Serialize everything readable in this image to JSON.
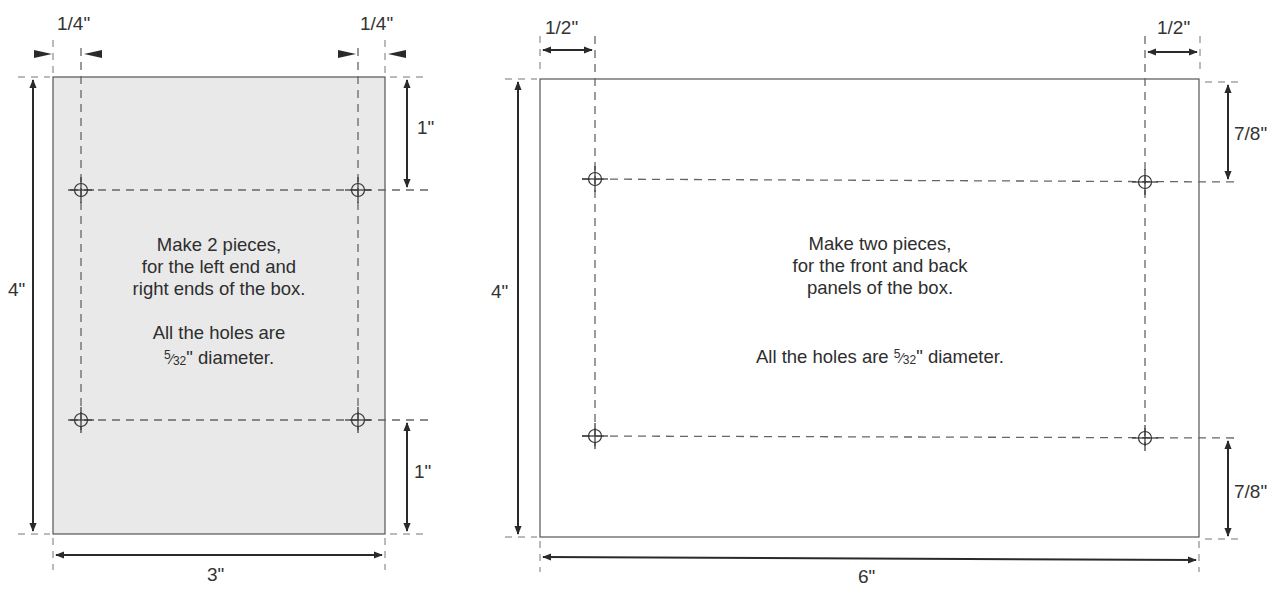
{
  "diagram": {
    "type": "technical-drawing",
    "units": "inches",
    "left_piece": {
      "name": "end panel",
      "fill": "#e9e9e9",
      "width_label": "3\"",
      "height_label": "4\"",
      "inset_left_label": "1/4\"",
      "inset_right_label": "1/4\"",
      "top_offset_label": "1\"",
      "bottom_offset_label": "1\"",
      "note_lines": [
        "Make 2 pieces,",
        "for the left end and",
        "right ends of the box."
      ],
      "hole_note_line1": "All the holes are",
      "hole_note_line2_suffix": "\" diameter.",
      "hole_diameter": {
        "num": "5",
        "den": "32"
      },
      "holes": 4
    },
    "right_piece": {
      "name": "front/back panel",
      "fill": "#ffffff",
      "width_label": "6\"",
      "height_label": "4\"",
      "inset_left_label": "1/2\"",
      "inset_right_label": "1/2\"",
      "top_offset_label": "7/8\"",
      "bottom_offset_label": "7/8\"",
      "note_lines": [
        "Make two pieces,",
        "for the front and back",
        "panels of the box."
      ],
      "hole_note_prefix": "All the holes are ",
      "hole_note_suffix": "\" diameter.",
      "hole_diameter": {
        "num": "5",
        "den": "32"
      },
      "holes": 4
    },
    "colors": {
      "line": "#444444",
      "dash": "#666666",
      "arrow": "#2a2a2a",
      "fill_left": "#e9e9e9"
    }
  }
}
